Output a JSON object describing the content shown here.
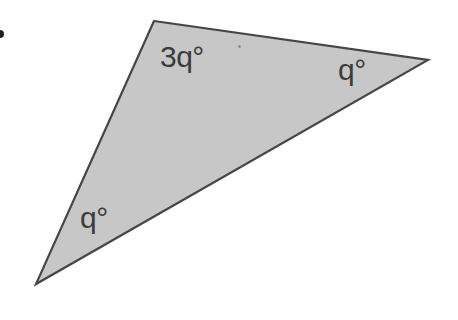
{
  "figure": {
    "triangle": {
      "points": "154,21 428,60 36,284",
      "fill_color": "#c7c7c7",
      "stroke_color": "#464646",
      "stroke_width": "2.2"
    },
    "angle_labels": {
      "top": {
        "text": "3q°"
      },
      "right": {
        "text": "q°"
      },
      "bottom_left": {
        "text": "q°"
      }
    },
    "label_color": "#3b3b3b",
    "bullet_marker_color": "#1f1f1f",
    "speck_color": "#8f8f8f",
    "background_color": "#ffffff"
  }
}
